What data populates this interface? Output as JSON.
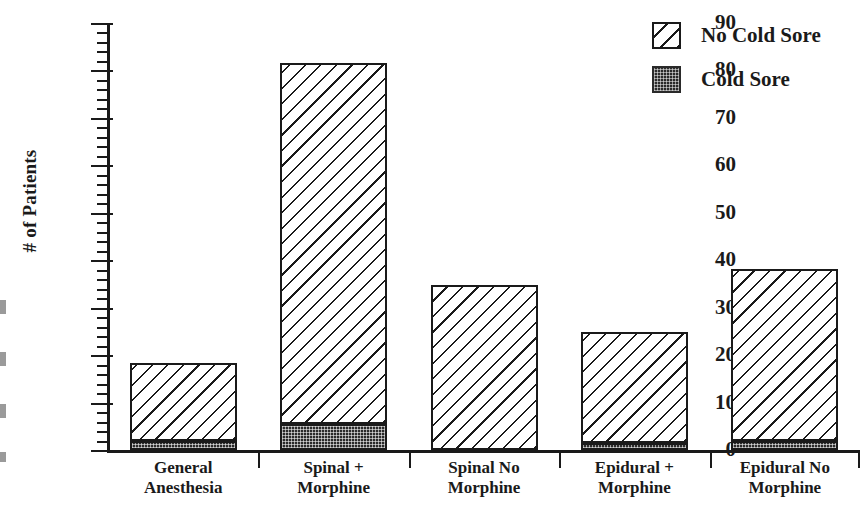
{
  "chart_data": {
    "type": "bar",
    "subtype": "stacked",
    "title": "",
    "xlabel": "",
    "ylabel": "# of Patients",
    "ylim": [
      0,
      90
    ],
    "ytick_step": 10,
    "yminor_step": 2,
    "grid": false,
    "legend_position": "top-right",
    "categories": [
      "General Anesthesia",
      "Spinal + Morphine",
      "Spinal No Morphine",
      "Epidural + Morphine",
      "Epidural No Morphine"
    ],
    "category_lines": [
      [
        "General",
        "Anesthesia"
      ],
      [
        "Spinal +",
        "Morphine"
      ],
      [
        "Spinal No",
        "Morphine"
      ],
      [
        "Epidural +",
        "Morphine"
      ],
      [
        "Epidural No",
        "Morphine"
      ]
    ],
    "ytick_labels": [
      "0",
      "10",
      "20",
      "30",
      "40",
      "50",
      "60",
      "70",
      "80",
      "90"
    ],
    "ytick_values": [
      0,
      10,
      20,
      30,
      40,
      50,
      60,
      70,
      80,
      90
    ],
    "series": [
      {
        "name": "Cold Sore",
        "pattern": "dark-stipple",
        "color": "#2a2a2a",
        "values": [
          2,
          5.5,
          0,
          1.5,
          2
        ]
      },
      {
        "name": "No Cold Sore",
        "pattern": "diagonal-hatch",
        "color": "#ffffff",
        "values": [
          16.4,
          76.1,
          34.8,
          23.4,
          36.2
        ]
      }
    ],
    "totals": [
      18.4,
      81.6,
      34.8,
      24.9,
      38.2
    ]
  },
  "legend": {
    "items": [
      {
        "label": "No Cold Sore",
        "swatch": "diagonal-hatch-swatch"
      },
      {
        "label": "Cold Sore",
        "swatch": "dark-stipple-swatch"
      }
    ]
  },
  "axis": {
    "y_title": "# of Patients"
  },
  "colors": {
    "ink": "#1a1a1a",
    "background": "#ffffff",
    "cold_sore_fill": "#2a2a2a"
  }
}
